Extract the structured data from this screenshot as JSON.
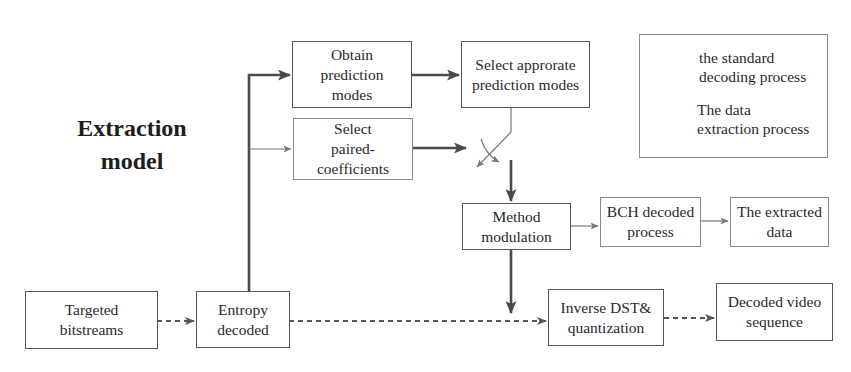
{
  "diagram": {
    "title": "Extraction\nmodel",
    "nodes": {
      "obtain_prediction_modes": "Obtain\nprediction\nmodes",
      "select_paired_coefficients": "Select\npaired-\ncoefficients",
      "select_appropriate_prediction_modes": "Select approrate\nprediction modes",
      "method_modulation": "Method\nmodulation",
      "bch_decoded_process": "BCH decoded\nprocess",
      "extracted_data": "The extracted\ndata",
      "targeted_bitstreams": "Targeted\nbitstreams",
      "entropy_decoded": "Entropy\ndecoded",
      "inverse_dst_quantization": "Inverse DST&\nquantization",
      "decoded_video_sequence": "Decoded video\nsequence"
    },
    "legend": {
      "solid_label": "the standard\ndecoding process",
      "dashed_label": "The data\nextraction process"
    },
    "edges": [
      {
        "from": "targeted_bitstreams",
        "to": "entropy_decoded",
        "style": "dashed"
      },
      {
        "from": "entropy_decoded",
        "to": "obtain_prediction_modes",
        "style": "solid-thick"
      },
      {
        "from": "entropy_decoded",
        "to": "select_paired_coefficients",
        "style": "solid-thin"
      },
      {
        "from": "obtain_prediction_modes",
        "to": "select_appropriate_prediction_modes",
        "style": "solid-thick"
      },
      {
        "from": "select_paired_coefficients",
        "to": "switch",
        "style": "solid-thick"
      },
      {
        "from": "select_appropriate_prediction_modes",
        "to": "switch",
        "style": "solid-thin"
      },
      {
        "from": "switch",
        "to": "method_modulation",
        "style": "solid-thick"
      },
      {
        "from": "method_modulation",
        "to": "bch_decoded_process",
        "style": "solid-thin"
      },
      {
        "from": "bch_decoded_process",
        "to": "extracted_data",
        "style": "solid-thin"
      },
      {
        "from": "method_modulation",
        "to": "inverse_dst_quantization",
        "style": "solid-thick"
      },
      {
        "from": "entropy_decoded",
        "to": "inverse_dst_quantization",
        "style": "dashed"
      },
      {
        "from": "inverse_dst_quantization",
        "to": "decoded_video_sequence",
        "style": "dashed"
      }
    ]
  }
}
